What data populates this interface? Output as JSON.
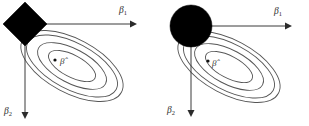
{
  "figure": {
    "background_color": "#ffffff",
    "width": 309,
    "height": 126,
    "panel_count": 2
  },
  "labels": {
    "beta1": "β",
    "beta1_sub": "1",
    "beta2": "β",
    "beta2_sub": "2",
    "beta_hat": "β̂"
  },
  "colors": {
    "constraint_fill": "#000000",
    "contour_stroke": "#555555",
    "axis_stroke": "#3a3a3a",
    "text": "#2e2e2e"
  },
  "panels": [
    {
      "id": "lasso",
      "constraint_shape": "diamond",
      "constraint_name": "L1 constraint region",
      "origin": {
        "x": 25,
        "y": 24
      },
      "diamond_radius_x": 22,
      "diamond_radius_y": 22,
      "beta_hat_point": {
        "x": 55,
        "y": 60
      },
      "beta_hat_label_pos": {
        "x": 60,
        "y": 64
      },
      "axis_h": {
        "x1": 25,
        "y1": 24,
        "x2": 133,
        "y2": 24
      },
      "axis_v": {
        "x1": 25,
        "y1": 24,
        "x2": 25,
        "y2": 116
      },
      "beta1_label_pos": {
        "x": 120,
        "y": 13
      },
      "beta2_label_pos": {
        "x": 5,
        "y": 114
      },
      "contours": [
        {
          "rx": 26,
          "ry": 11
        },
        {
          "rx": 38,
          "ry": 17
        },
        {
          "rx": 50,
          "ry": 23
        },
        {
          "rx": 56,
          "ry": 27
        }
      ],
      "contour_center": {
        "x": 72,
        "y": 66
      },
      "contour_rotation_deg": 28
    },
    {
      "id": "ridge",
      "constraint_shape": "circle",
      "constraint_name": "L2 constraint region",
      "origin": {
        "x": 36,
        "y": 26
      },
      "circle_radius": 21,
      "beta_hat_point": {
        "x": 53,
        "y": 61
      },
      "beta_hat_label_pos": {
        "x": 57,
        "y": 66
      },
      "axis_h": {
        "x1": 36,
        "y1": 26,
        "x2": 133,
        "y2": 26
      },
      "axis_v": {
        "x1": 36,
        "y1": 26,
        "x2": 36,
        "y2": 116
      },
      "beta1_label_pos": {
        "x": 119,
        "y": 14
      },
      "beta2_label_pos": {
        "x": 13,
        "y": 113
      },
      "contours": [
        {
          "rx": 26,
          "ry": 11
        },
        {
          "rx": 38,
          "ry": 17
        },
        {
          "rx": 50,
          "ry": 23
        },
        {
          "rx": 56,
          "ry": 27
        }
      ],
      "contour_center": {
        "x": 74,
        "y": 67
      },
      "contour_rotation_deg": 28
    }
  ]
}
